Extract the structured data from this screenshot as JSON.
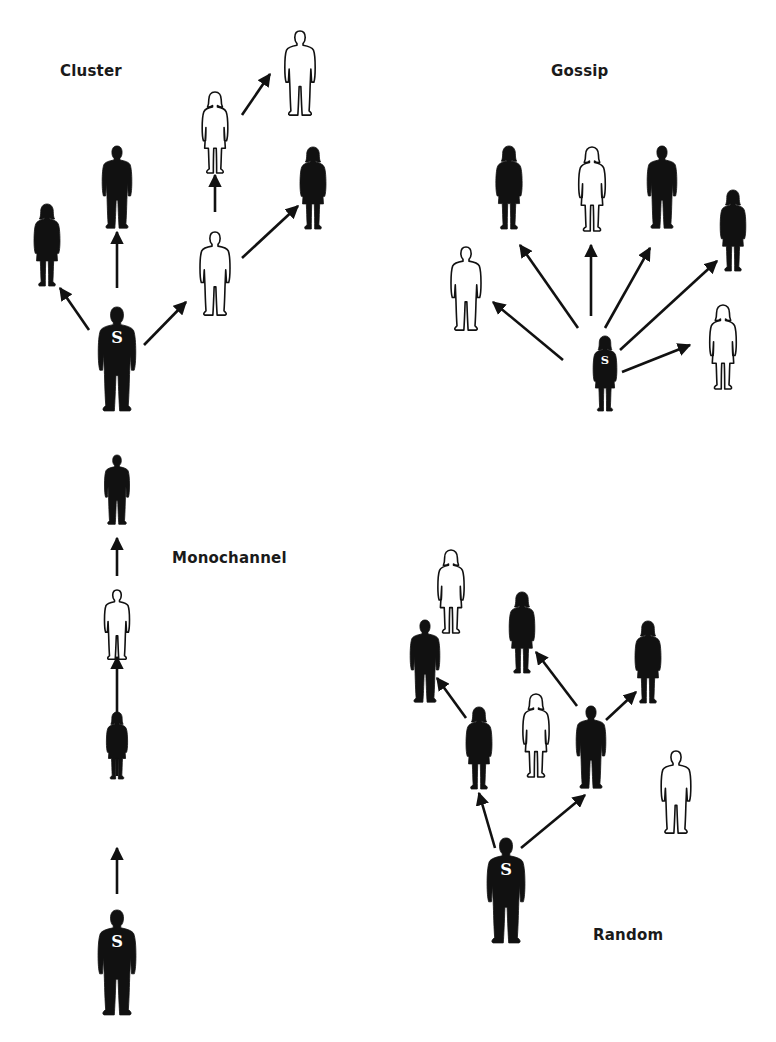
{
  "diagram": {
    "colors": {
      "filled": "#111111",
      "outline": "#111111",
      "background": "#ffffff",
      "source_letter": "#ffffff"
    },
    "source_marker": "S",
    "panels": [
      {
        "id": "cluster",
        "label": "Cluster",
        "label_pos": [
          60,
          75
        ],
        "figures": [
          {
            "id": "c0",
            "kind": "man",
            "fill": "black",
            "cx": 117,
            "top": 307,
            "bottom": 412,
            "source": true
          },
          {
            "id": "c1",
            "kind": "woman",
            "fill": "black",
            "cx": 47,
            "top": 204,
            "bottom": 286
          },
          {
            "id": "c2",
            "kind": "man",
            "fill": "black",
            "cx": 117,
            "top": 146,
            "bottom": 229
          },
          {
            "id": "c3",
            "kind": "man",
            "fill": "white",
            "cx": 215,
            "top": 232,
            "bottom": 316
          },
          {
            "id": "c4",
            "kind": "woman",
            "fill": "white",
            "cx": 215,
            "top": 92,
            "bottom": 173
          },
          {
            "id": "c5",
            "kind": "man",
            "fill": "white",
            "cx": 300,
            "top": 31,
            "bottom": 116
          },
          {
            "id": "c6",
            "kind": "woman",
            "fill": "black",
            "cx": 313,
            "top": 147,
            "bottom": 229
          }
        ],
        "arrows": [
          {
            "from": [
              89,
              330
            ],
            "to": [
              60,
              288
            ]
          },
          {
            "from": [
              117,
              288
            ],
            "to": [
              117,
              232
            ]
          },
          {
            "from": [
              144,
              345
            ],
            "to": [
              186,
              302
            ]
          },
          {
            "from": [
              215,
              212
            ],
            "to": [
              215,
              175
            ]
          },
          {
            "from": [
              242,
              258
            ],
            "to": [
              298,
              206
            ]
          },
          {
            "from": [
              242,
              115
            ],
            "to": [
              270,
              74
            ]
          }
        ]
      },
      {
        "id": "gossip",
        "label": "Gossip",
        "label_pos": [
          551,
          75
        ],
        "figures": [
          {
            "id": "g0",
            "kind": "woman",
            "fill": "black",
            "cx": 605,
            "top": 336,
            "bottom": 411,
            "source": true
          },
          {
            "id": "g1",
            "kind": "man",
            "fill": "white",
            "cx": 466,
            "top": 247,
            "bottom": 331
          },
          {
            "id": "g2",
            "kind": "woman",
            "fill": "black",
            "cx": 509,
            "top": 146,
            "bottom": 229
          },
          {
            "id": "g3",
            "kind": "woman",
            "fill": "white",
            "cx": 592,
            "top": 147,
            "bottom": 231
          },
          {
            "id": "g4",
            "kind": "man",
            "fill": "black",
            "cx": 662,
            "top": 146,
            "bottom": 229
          },
          {
            "id": "g5",
            "kind": "woman",
            "fill": "black",
            "cx": 733,
            "top": 190,
            "bottom": 271
          },
          {
            "id": "g6",
            "kind": "woman",
            "fill": "white",
            "cx": 723,
            "top": 305,
            "bottom": 389
          }
        ],
        "arrows": [
          {
            "from": [
              563,
              360
            ],
            "to": [
              493,
              302
            ]
          },
          {
            "from": [
              578,
              328
            ],
            "to": [
              520,
              245
            ]
          },
          {
            "from": [
              591,
              316
            ],
            "to": [
              591,
              245
            ]
          },
          {
            "from": [
              605,
              328
            ],
            "to": [
              650,
              248
            ]
          },
          {
            "from": [
              620,
              350
            ],
            "to": [
              717,
              261
            ]
          },
          {
            "from": [
              622,
              372
            ],
            "to": [
              690,
              345
            ]
          }
        ]
      },
      {
        "id": "monochannel",
        "label": "Monochannel",
        "label_pos": [
          172,
          561
        ],
        "figures": [
          {
            "id": "m0",
            "kind": "man",
            "fill": "black",
            "cx": 117,
            "top": 910,
            "bottom": 1016,
            "source": true
          },
          {
            "id": "m1",
            "kind": "woman",
            "fill": "black",
            "cx": 117,
            "top": 712,
            "bottom": 779
          },
          {
            "id": "m2",
            "kind": "man",
            "fill": "white",
            "cx": 117,
            "top": 590,
            "bottom": 660
          },
          {
            "id": "m3",
            "kind": "man",
            "fill": "black",
            "cx": 117,
            "top": 455,
            "bottom": 525
          }
        ],
        "arrows": [
          {
            "from": [
              117,
              894
            ],
            "to": [
              117,
              848
            ]
          },
          {
            "from": [
              117,
              776
            ],
            "to": [
              117,
              657
            ]
          },
          {
            "from": [
              117,
              655
            ],
            "to": [
              117,
              660
            ]
          },
          {
            "from": [
              117,
              576
            ],
            "to": [
              117,
              538
            ]
          }
        ]
      },
      {
        "id": "random",
        "label": "Random",
        "label_pos": [
          593,
          938
        ],
        "figures": [
          {
            "id": "r0",
            "kind": "man",
            "fill": "black",
            "cx": 506,
            "top": 838,
            "bottom": 944,
            "source": true
          },
          {
            "id": "r1",
            "kind": "woman",
            "fill": "black",
            "cx": 479,
            "top": 707,
            "bottom": 789
          },
          {
            "id": "r2",
            "kind": "man",
            "fill": "black",
            "cx": 591,
            "top": 706,
            "bottom": 789
          },
          {
            "id": "r3",
            "kind": "man",
            "fill": "black",
            "cx": 425,
            "top": 620,
            "bottom": 703
          },
          {
            "id": "r4",
            "kind": "woman",
            "fill": "white",
            "cx": 451,
            "top": 550,
            "bottom": 633
          },
          {
            "id": "r5",
            "kind": "woman",
            "fill": "black",
            "cx": 522,
            "top": 592,
            "bottom": 673
          },
          {
            "id": "r6",
            "kind": "woman",
            "fill": "white",
            "cx": 536,
            "top": 694,
            "bottom": 777
          },
          {
            "id": "r7",
            "kind": "woman",
            "fill": "black",
            "cx": 648,
            "top": 621,
            "bottom": 703
          },
          {
            "id": "r8",
            "kind": "man",
            "fill": "white",
            "cx": 676,
            "top": 751,
            "bottom": 834
          }
        ],
        "arrows": [
          {
            "from": [
              495,
              848
            ],
            "to": [
              479,
              793
            ]
          },
          {
            "from": [
              521,
              848
            ],
            "to": [
              585,
              795
            ]
          },
          {
            "from": [
              466,
              718
            ],
            "to": [
              437,
              678
            ]
          },
          {
            "from": [
              577,
              706
            ],
            "to": [
              536,
              652
            ]
          },
          {
            "from": [
              606,
              720
            ],
            "to": [
              636,
              692
            ]
          }
        ]
      }
    ]
  }
}
